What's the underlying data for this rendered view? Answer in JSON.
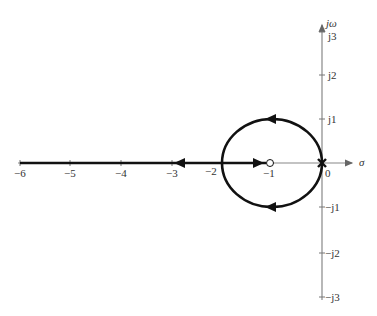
{
  "diagram": {
    "type": "root-locus",
    "axes": {
      "real_axis_label": "σ",
      "imag_axis_label": "jω",
      "real_ticks": [
        "−6",
        "−5",
        "−4",
        "−3",
        "−2",
        "−1",
        "0"
      ],
      "imag_ticks_positive": [
        "j1",
        "j2",
        "j3"
      ],
      "imag_ticks_negative": [
        "−j1",
        "−j2",
        "−j3"
      ]
    },
    "poles": [
      {
        "label": "double pole at origin",
        "real": 0,
        "imag": 0,
        "marker": "x"
      }
    ],
    "zeros": [
      {
        "label": "zero",
        "real": -1,
        "imag": 0,
        "marker": "o"
      }
    ],
    "branches": [
      {
        "name": "circle",
        "center": -1,
        "radius": 1,
        "direction": "counter-flow from origin around to breakaway at -2"
      },
      {
        "name": "real-axis-right",
        "from": -2,
        "to": -1,
        "direction": "toward zero"
      },
      {
        "name": "real-axis-left",
        "from": -2,
        "to": "-infinity",
        "direction": "toward -infinity"
      }
    ],
    "colors": {
      "locus": "#111111",
      "axis": "#888888",
      "text": "#333333"
    }
  }
}
